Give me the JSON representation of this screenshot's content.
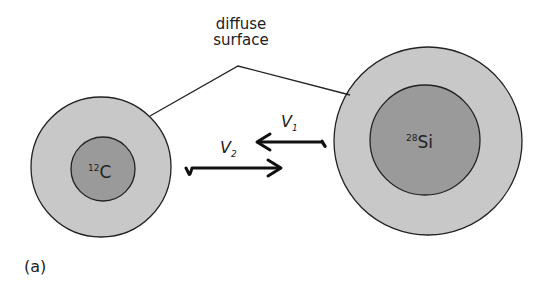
{
  "diagram": {
    "label_surface_line1": "diffuse",
    "label_surface_line2": "surface",
    "nucleus_left": {
      "mass": "12",
      "symbol": "C"
    },
    "nucleus_right": {
      "mass": "28",
      "symbol": "Si"
    },
    "velocity_1": {
      "symbol": "V",
      "subscript": "1"
    },
    "velocity_2": {
      "symbol": "V",
      "subscript": "2"
    },
    "panel_label": "(a)",
    "colors": {
      "outer": "#c8c8c8",
      "inner": "#9a9a9a",
      "stroke": "#222222"
    }
  }
}
